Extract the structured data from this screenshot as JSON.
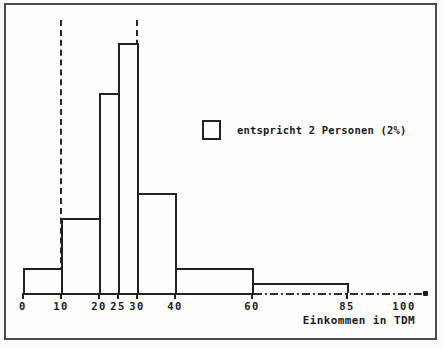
{
  "window": {
    "background": "#fbfbfa",
    "frame_border_color": "#4a4a4a",
    "line_color": "#222222"
  },
  "chart_data": {
    "type": "bar",
    "subtype": "histogram",
    "title": "",
    "xlabel": "Einkommen in TDM",
    "ylabel": "",
    "grid": false,
    "xlim": [
      0,
      107
    ],
    "axis_arrow_end": true,
    "unit_square": {
      "persons": 2,
      "percent": 2,
      "meaning": "one square of bar height equals 2 Personen (2%)"
    },
    "bins": [
      {
        "from": 0,
        "to": 10,
        "height_units": 1
      },
      {
        "from": 10,
        "to": 20,
        "height_units": 3
      },
      {
        "from": 20,
        "to": 25,
        "height_units": 8
      },
      {
        "from": 25,
        "to": 30,
        "height_units": 10
      },
      {
        "from": 30,
        "to": 40,
        "height_units": 4
      },
      {
        "from": 40,
        "to": 60,
        "height_units": 1
      },
      {
        "from": 60,
        "to": 85,
        "height_units": 0.4
      }
    ],
    "reference_lines_x": [
      10,
      30
    ],
    "x_ticks": [
      {
        "value": 0,
        "label": "0",
        "mark": true
      },
      {
        "value": 10,
        "label": "10",
        "mark": true
      },
      {
        "value": 20,
        "label": "20",
        "mark": true
      },
      {
        "value": 25,
        "label": "25",
        "mark": true
      },
      {
        "value": 30,
        "label": "30",
        "mark": true
      },
      {
        "value": 40,
        "label": "40",
        "mark": true
      },
      {
        "value": 60,
        "label": "60",
        "mark": true
      },
      {
        "value": 85,
        "label": "85",
        "mark": true
      },
      {
        "value": 100,
        "label": "100",
        "mark": false
      }
    ],
    "legend": {
      "position": "middle-right",
      "swatch": "empty-square",
      "label": "entspricht 2 Personen (2%)"
    }
  }
}
